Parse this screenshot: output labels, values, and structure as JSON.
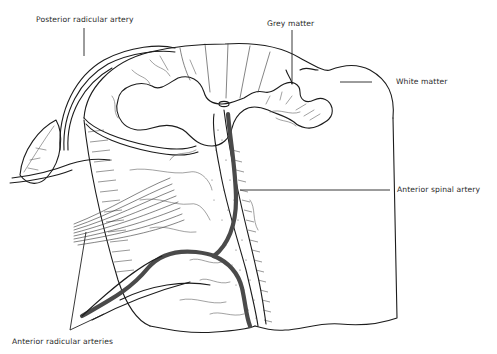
{
  "figure": {
    "labels": {
      "posterior_radicular_artery": "Posterior radicular artery",
      "grey_matter": "Grey matter",
      "white_matter": "White matter",
      "anterior_spinal_artery": "Anterior spinal artery",
      "anterior_radicular_arteries": "Anterior radicular arteries"
    },
    "colors": {
      "line": "#1c1c1c",
      "artery": "#4a4a4a",
      "background": "#ffffff",
      "text": "#2a2a2a"
    }
  }
}
